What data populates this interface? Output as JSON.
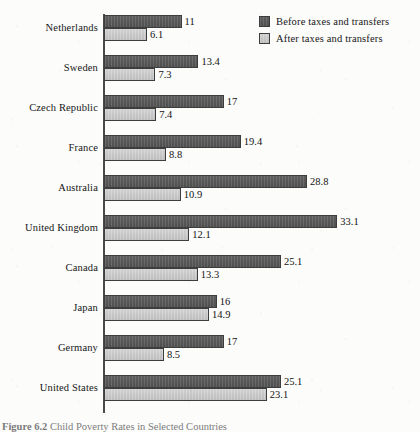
{
  "chart_data": {
    "type": "bar",
    "orientation": "horizontal",
    "title": "",
    "xlabel": "",
    "ylabel": "",
    "xlim": [
      0,
      35
    ],
    "grid": false,
    "legend_position": "top-right",
    "categories": [
      "Netherlands",
      "Sweden",
      "Czech Republic",
      "France",
      "Australia",
      "United Kingdom",
      "Canada",
      "Japan",
      "Germany",
      "United States"
    ],
    "series": [
      {
        "name": "Before taxes and transfers",
        "color": "#575757",
        "values": [
          11,
          13.4,
          17,
          19.4,
          28.8,
          33.1,
          25.1,
          16,
          17,
          25.1
        ],
        "labels": [
          "11",
          "13.4",
          "17",
          "19.4",
          "28.8",
          "33.1",
          "25.1",
          "16",
          "17",
          "25.1"
        ]
      },
      {
        "name": "After taxes and transfers",
        "color": "#c8c8c8",
        "values": [
          6.1,
          7.3,
          7.4,
          8.8,
          10.9,
          12.1,
          13.3,
          14.9,
          8.5,
          23.1
        ],
        "labels": [
          "6.1",
          "7.3",
          "7.4",
          "8.8",
          "10.9",
          "12.1",
          "13.3",
          "14.9",
          "8.5",
          "23.1"
        ]
      }
    ]
  },
  "legend": {
    "items": [
      {
        "label": "Before taxes and transfers",
        "swatch": "before"
      },
      {
        "label": "After taxes and transfers",
        "swatch": "after"
      }
    ]
  },
  "caption": {
    "number": "Figure 6.2",
    "text": "Child Poverty Rates in Selected Countries"
  }
}
